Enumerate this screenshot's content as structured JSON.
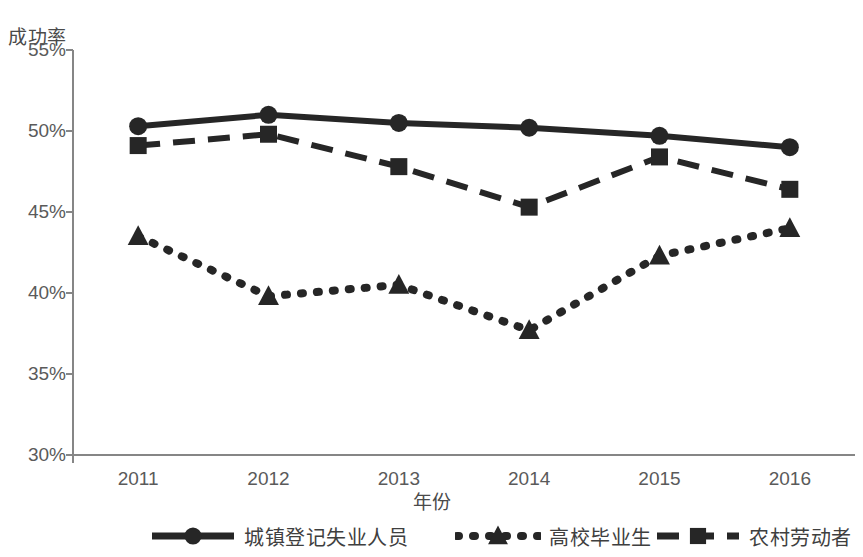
{
  "chart_data": {
    "type": "line",
    "title": "",
    "xlabel": "年份",
    "ylabel": "成功率",
    "categories": [
      "2011",
      "2012",
      "2013",
      "2014",
      "2015",
      "2016"
    ],
    "ytick_labels": [
      "55%",
      "50%",
      "45%",
      "40%",
      "35%",
      "30%"
    ],
    "ytick_values": [
      55,
      50,
      45,
      40,
      35,
      30
    ],
    "ylim": [
      30,
      55
    ],
    "grid": false,
    "legend_position": "bottom",
    "series": [
      {
        "name": "城镇登记失业人员",
        "marker": "circle",
        "line_style": "solid",
        "color": "#262626",
        "values": [
          50.3,
          51.0,
          50.5,
          50.2,
          49.7,
          49.0
        ]
      },
      {
        "name": "高校毕业生",
        "marker": "triangle",
        "line_style": "dotted",
        "color": "#262626",
        "values": [
          43.5,
          39.8,
          40.5,
          37.7,
          42.3,
          44.0
        ]
      },
      {
        "name": "农村劳动者",
        "marker": "square",
        "line_style": "dashed",
        "color": "#262626",
        "values": [
          49.1,
          49.8,
          47.8,
          45.3,
          48.4,
          46.4
        ]
      }
    ]
  },
  "axes": {
    "y_title": "成功率",
    "x_title": "年份"
  },
  "legend": {
    "items": [
      {
        "label": "城镇登记失业人员",
        "marker": "circle",
        "line_style": "solid"
      },
      {
        "label": "高校毕业生",
        "marker": "triangle",
        "line_style": "dotted"
      },
      {
        "label": "农村劳动者",
        "marker": "square",
        "line_style": "dashed"
      }
    ]
  }
}
